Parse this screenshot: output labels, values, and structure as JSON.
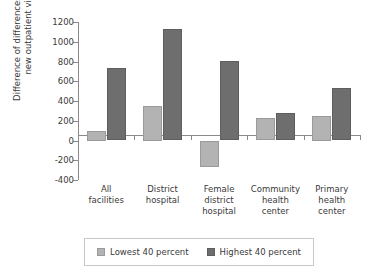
{
  "chart_data": {
    "type": "bar",
    "title": "",
    "xlabel": "",
    "ylabel": "Difference of differences in mean\nnew outpatient visits",
    "ylim": [
      -400,
      1200
    ],
    "yticks": [
      -400,
      -200,
      0,
      200,
      400,
      600,
      800,
      1000,
      1200
    ],
    "ytick_labels": [
      "-400",
      "-200",
      "0",
      "200",
      "400",
      "600",
      "800",
      "1000",
      "1200"
    ],
    "grid": false,
    "legend_position": "bottom",
    "categories": [
      "All\nfacilities",
      "District\nhospital",
      "Female\ndistrict\nhospital",
      "Community\nhealth\ncenter",
      "Primary\nhealth\ncenter"
    ],
    "series": [
      {
        "name": "Lowest 40 percent",
        "color": "#b3b3b3",
        "values": [
          100,
          350,
          -270,
          230,
          250
        ]
      },
      {
        "name": "Highest 40 percent",
        "color": "#6e6e6e",
        "values": [
          730,
          1130,
          810,
          280,
          530
        ]
      }
    ]
  }
}
